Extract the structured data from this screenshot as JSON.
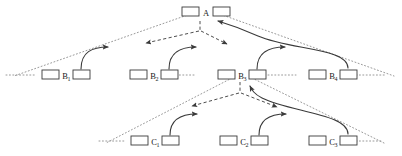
{
  "diagram": {
    "colors": {
      "stroke": "#3a3a3a",
      "dotted": "#9a9a9a",
      "dashed": "#4a4a4a",
      "text": "#1a1a1a",
      "background": "#ffffff",
      "box_fill": "#ffffff"
    },
    "levels": [
      {
        "name": "level-a",
        "labels": [
          "A"
        ]
      },
      {
        "name": "level-b",
        "labels": [
          "B",
          "B",
          "B",
          "B"
        ]
      },
      {
        "name": "level-c",
        "labels": [
          "C",
          "C",
          "C"
        ]
      }
    ],
    "nodes": [
      {
        "id": "A",
        "label": "A",
        "sub": "",
        "x": 200,
        "y": 13
      },
      {
        "id": "B1",
        "label": "B",
        "sub": "1",
        "x": 65,
        "y": 74
      },
      {
        "id": "B2",
        "label": "B",
        "sub": "2",
        "x": 152,
        "y": 74
      },
      {
        "id": "B3",
        "label": "B",
        "sub": "3",
        "x": 240,
        "y": 74
      },
      {
        "id": "B4",
        "label": "B",
        "sub": "4",
        "x": 331,
        "y": 74
      },
      {
        "id": "C1",
        "label": "C",
        "sub": "1",
        "x": 154,
        "y": 140
      },
      {
        "id": "C2",
        "label": "C",
        "sub": "2",
        "x": 243,
        "y": 140
      },
      {
        "id": "C3",
        "label": "C",
        "sub": "3",
        "x": 331,
        "y": 140
      }
    ],
    "edges": {
      "dotted_cones": [
        {
          "name": "cone-a-left",
          "from": "A",
          "to": "far-left"
        },
        {
          "name": "cone-a-right",
          "from": "A",
          "to": "far-right"
        },
        {
          "name": "cone-b3-left",
          "from": "B3",
          "to": "lower-left"
        },
        {
          "name": "cone-b3-right",
          "from": "B3",
          "to": "lower-right"
        }
      ],
      "dashed_expansions": [
        {
          "name": "expand-a-left",
          "from": "A",
          "to": "B1-direction"
        },
        {
          "name": "expand-a-right",
          "from": "A",
          "to": "B3-direction"
        },
        {
          "name": "expand-b3-left",
          "from": "B3",
          "to": "C1-direction"
        },
        {
          "name": "expand-b3-right",
          "from": "B3",
          "to": "C3-direction"
        }
      ],
      "solid_transitions": [
        {
          "name": "arrow-b1-to-b2",
          "from": "B1",
          "to": "B2"
        },
        {
          "name": "arrow-b2-to-b3",
          "from": "B2",
          "to": "B3"
        },
        {
          "name": "arrow-b3-to-b4",
          "from": "B3",
          "to": "B4"
        },
        {
          "name": "arrow-b4-to-a",
          "from": "B4",
          "to": "A"
        },
        {
          "name": "arrow-c1-to-c2",
          "from": "C1",
          "to": "C2"
        },
        {
          "name": "arrow-c2-to-c3",
          "from": "C2",
          "to": "C3"
        },
        {
          "name": "arrow-c3-to-b3",
          "from": "C3",
          "to": "B3"
        }
      ]
    }
  }
}
